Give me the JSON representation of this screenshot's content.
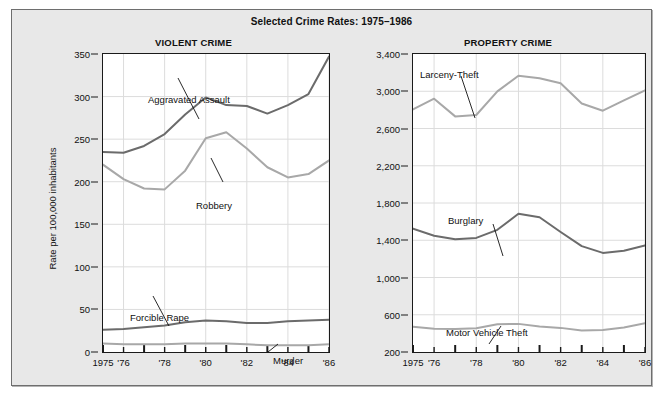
{
  "figure": {
    "title": "Selected Crime Rates: 1975–1986",
    "background_color": "#e8e8e8",
    "plot_background_color": "#ffffff"
  },
  "panels": [
    {
      "key": "violent",
      "heading": "VIOLENT CRIME",
      "axis_title": "Rate per 100,000 inhabitants"
    },
    {
      "key": "property",
      "heading": "PROPERTY CRIME",
      "axis_title": ""
    }
  ],
  "axis": {
    "x_tick_labels": [
      "1975",
      "'76",
      "",
      "'78",
      "",
      "'80",
      "",
      "'82",
      "",
      "'84",
      "",
      "'86"
    ],
    "violent_y_ticks": [
      "0",
      "50",
      "100",
      "150",
      "200",
      "250",
      "300",
      "350"
    ],
    "property_y_ticks": [
      "200",
      "600",
      "1,000",
      "1,400",
      "1,800",
      "2,200",
      "2,600",
      "3,000",
      "3,400"
    ]
  },
  "series_labels": {
    "aggravated_assault": "Aggravated Assault",
    "robbery": "Robbery",
    "forcible_rape": "Forcible Rape",
    "murder": "Murder",
    "larceny_theft": "Larceny-Theft",
    "burglary": "Burglary",
    "motor_vehicle_theft": "Motor Vehicle Theft"
  },
  "colors": {
    "dark_line": "#6b6b6b",
    "light_line": "#a8a8a8",
    "axis": "#1a1a1a",
    "grid": "#dcdcdc",
    "text": "#111111"
  },
  "chart_data": [
    {
      "type": "line",
      "title": "VIOLENT CRIME",
      "xlabel": "",
      "ylabel": "Rate per 100,000 inhabitants",
      "x": [
        1975,
        1976,
        1977,
        1978,
        1979,
        1980,
        1981,
        1982,
        1983,
        1984,
        1985,
        1986
      ],
      "xtick_labels": [
        "1975",
        "'76",
        "'77",
        "'78",
        "'79",
        "'80",
        "'81",
        "'82",
        "'83",
        "'84",
        "'85",
        "'86"
      ],
      "ylim": [
        0,
        350
      ],
      "yticks": [
        0,
        50,
        100,
        150,
        200,
        250,
        300,
        350
      ],
      "grid": true,
      "legend": "inline-annotations",
      "series": [
        {
          "name": "Aggravated Assault",
          "color": "#6b6b6b",
          "values": [
            235,
            234,
            242,
            256,
            279,
            299,
            290,
            289,
            280,
            290,
            303,
            347
          ]
        },
        {
          "name": "Robbery",
          "color": "#a8a8a8",
          "values": [
            220,
            203,
            192,
            191,
            213,
            251,
            258,
            239,
            217,
            205,
            209,
            225
          ]
        },
        {
          "name": "Forcible Rape",
          "color": "#6b6b6b",
          "values": [
            26,
            27,
            29,
            31,
            35,
            37,
            36,
            34,
            34,
            36,
            37,
            38
          ]
        },
        {
          "name": "Murder",
          "color": "#a8a8a8",
          "values": [
            10,
            9,
            9,
            9,
            10,
            10,
            10,
            9,
            8,
            8,
            8,
            9
          ]
        }
      ]
    },
    {
      "type": "line",
      "title": "PROPERTY CRIME",
      "xlabel": "",
      "ylabel": "",
      "x": [
        1975,
        1976,
        1977,
        1978,
        1979,
        1980,
        1981,
        1982,
        1983,
        1984,
        1985,
        1986
      ],
      "xtick_labels": [
        "1975",
        "'76",
        "'77",
        "'78",
        "'79",
        "'80",
        "'81",
        "'82",
        "'83",
        "'84",
        "'85",
        "'86"
      ],
      "ylim": [
        200,
        3400
      ],
      "yticks": [
        200,
        600,
        1000,
        1400,
        1800,
        2200,
        2600,
        3000,
        3400
      ],
      "grid": true,
      "legend": "inline-annotations",
      "series": [
        {
          "name": "Larceny-Theft",
          "color": "#a8a8a8",
          "values": [
            2805,
            2920,
            2730,
            2745,
            2999,
            3167,
            3140,
            3085,
            2869,
            2791,
            2901,
            3010
          ]
        },
        {
          "name": "Burglary",
          "color": "#6b6b6b",
          "values": [
            1525,
            1448,
            1410,
            1425,
            1512,
            1684,
            1647,
            1489,
            1337,
            1264,
            1287,
            1345
          ]
        },
        {
          "name": "Motor Vehicle Theft",
          "color": "#a8a8a8",
          "values": [
            470,
            450,
            448,
            455,
            498,
            502,
            475,
            459,
            431,
            437,
            462,
            508
          ]
        }
      ]
    }
  ]
}
